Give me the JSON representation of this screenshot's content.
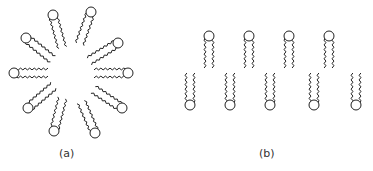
{
  "figure": {
    "panels": [
      {
        "id": "a",
        "label": "(a)",
        "structure": "micelle",
        "center": [
          69,
          73
        ],
        "lipid_count": 10,
        "heads": [
          [
            14,
            73
          ],
          [
            26,
            38
          ],
          [
            53,
            15
          ],
          [
            91,
            12
          ],
          [
            118,
            43
          ],
          [
            128,
            73
          ],
          [
            122,
            108
          ],
          [
            95,
            133
          ],
          [
            54,
            131
          ],
          [
            28,
            108
          ]
        ]
      },
      {
        "id": "b",
        "label": "(b)",
        "structure": "bilayer",
        "top_leaflet_heads_x": [
          209,
          249,
          289,
          329
        ],
        "top_head_y": 36,
        "bottom_leaflet_heads_x": [
          190,
          230,
          270,
          314,
          356
        ],
        "bottom_head_y": 105
      }
    ],
    "stroke_color": "#222222"
  }
}
